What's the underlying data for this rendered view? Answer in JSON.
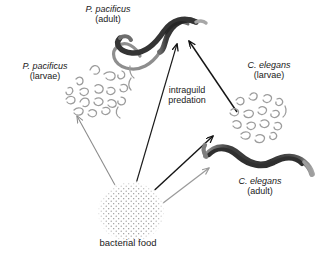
{
  "figure": {
    "background_color": "#ffffff"
  },
  "labels": {
    "p_pacificus_adult": {
      "species": "P. pacificus",
      "stage": "(adult)"
    },
    "p_pacificus_larvae": {
      "species": "P. pacificus",
      "stage": "(larvae)"
    },
    "c_elegans_larvae": {
      "species": "C. elegans",
      "stage": "(larvae)"
    },
    "c_elegans_adult": {
      "species": "C. elegans",
      "stage": "(adult)"
    },
    "interaction": {
      "line1": "intraguild",
      "line2": "predation"
    },
    "resource": {
      "text": "bacterial food"
    }
  },
  "colors": {
    "dark_arrow": "#111111",
    "light_arrow": "#9a9a9a",
    "worm_dark": "#3c3c3c",
    "worm_mid": "#6f6f6f",
    "larva_stroke": "#9c9c9c",
    "food_dot": "#8e8e8e",
    "text": "#1a1a1a"
  },
  "nodes": [
    {
      "name": "p-pacificus-adult",
      "kind": "worm",
      "shade": "dark"
    },
    {
      "name": "p-pacificus-larvae",
      "kind": "larvae-cluster",
      "count": 17
    },
    {
      "name": "c-elegans-larvae",
      "kind": "larvae-cluster",
      "count": 16
    },
    {
      "name": "c-elegans-adult",
      "kind": "worm",
      "shade": "dark"
    },
    {
      "name": "bacterial-food",
      "kind": "stipple-patch"
    }
  ],
  "edges": [
    {
      "name": "food-to-p-pacificus-larvae",
      "from": "bacterial-food",
      "to": "p-pacificus-larvae",
      "style": "thin-gray"
    },
    {
      "name": "food-to-p-pacificus-adult",
      "from": "bacterial-food",
      "to": "p-pacificus-adult",
      "style": "thin-gray"
    },
    {
      "name": "food-to-c-elegans-larvae",
      "from": "bacterial-food",
      "to": "c-elegans-larvae",
      "style": "dark"
    },
    {
      "name": "food-to-c-elegans-adult",
      "from": "bacterial-food",
      "to": "c-elegans-adult",
      "style": "light-gray"
    },
    {
      "name": "c-elegans-larvae-to-p-pacificus-adult",
      "from": "c-elegans-larvae",
      "to": "p-pacificus-adult",
      "style": "dark",
      "interaction": "intraguild predation"
    }
  ]
}
